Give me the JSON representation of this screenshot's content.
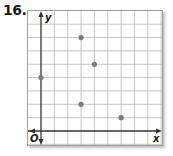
{
  "problem_number": "16.",
  "chart_data": {
    "type": "scatter",
    "title": "",
    "xlabel": "x",
    "ylabel": "y",
    "origin_label": "O",
    "grid": true,
    "xlim": [
      -1,
      9
    ],
    "ylim": [
      -1,
      9
    ],
    "tick_labels": false,
    "points": [
      {
        "x": 0,
        "y": 4
      },
      {
        "x": 3,
        "y": 7
      },
      {
        "x": 4,
        "y": 5
      },
      {
        "x": 3,
        "y": 2
      },
      {
        "x": 6,
        "y": 1
      }
    ],
    "point_color": "#7a7a7a",
    "grid_color": "#b8b8b8",
    "axis_color": "#333333"
  }
}
